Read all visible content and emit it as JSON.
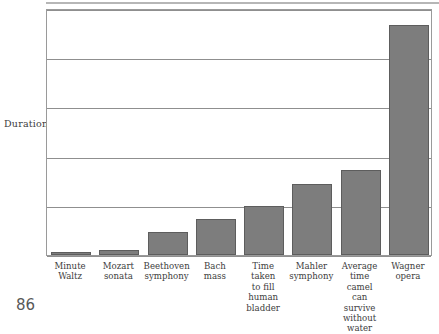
{
  "page": {
    "number": "86"
  },
  "chart_data": {
    "type": "bar",
    "title": "",
    "subtitle": "",
    "xlabel": "",
    "ylabel": "Duration",
    "grid": true,
    "legend": false,
    "axis": {
      "y_gridline_count": 6,
      "y_tick_labels": [],
      "ylim_note": "unlabeled ordinal duration scale"
    },
    "categories": [
      "Minute Waltz",
      "Mozart sonata",
      "Beethoven symphony",
      "Bach mass",
      "Time taken to fill human bladder",
      "Mahler symphony",
      "Average time camel can survive without water",
      "Wagner opera"
    ],
    "category_lines": [
      [
        "Minute",
        "Waltz"
      ],
      [
        "Mozart",
        "sonata"
      ],
      [
        "Beethoven",
        "symphony"
      ],
      [
        "Bach",
        "mass"
      ],
      [
        "Time",
        "taken",
        "to fill",
        "human",
        "bladder"
      ],
      [
        "Mahler",
        "symphony"
      ],
      [
        "Average",
        "time",
        "camel",
        "can",
        "survive",
        "without",
        "water"
      ],
      [
        "Wagner",
        "opera"
      ]
    ],
    "values": [
      1.2,
      2.0,
      9.3,
      14.6,
      19.8,
      28.7,
      34.4,
      93.1
    ],
    "value_units": "relative duration (percent of axis height)",
    "colors": {
      "bar_fill": "#7d7d7d",
      "bar_border": "#5d5d5d",
      "gridline": "#8f8f8f",
      "frame": "#9a9a9a",
      "text": "#3d3d3d",
      "background": "#ffffff"
    }
  }
}
